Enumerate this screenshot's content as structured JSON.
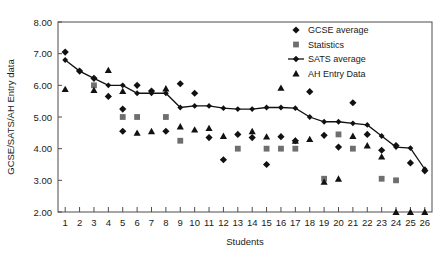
{
  "chart_data": {
    "type": "scatter",
    "title": "",
    "xlabel": "Students",
    "ylabel": "GCSE/SATS/AH Entry data",
    "xlim": [
      0.5,
      26.5
    ],
    "ylim": [
      2.0,
      8.0
    ],
    "ytick_labels": [
      "8.00",
      "7.00",
      "6.00",
      "5.00",
      "4.00",
      "3.00",
      "2.00"
    ],
    "ytick_values": [
      8,
      7,
      6,
      5,
      4,
      3,
      2
    ],
    "categories": [
      1,
      2,
      3,
      4,
      5,
      6,
      7,
      8,
      9,
      10,
      11,
      12,
      13,
      14,
      15,
      16,
      17,
      18,
      19,
      20,
      21,
      22,
      23,
      24,
      25,
      26
    ],
    "xtick_labels": [
      "1",
      "2",
      "3",
      "4",
      "5",
      "6",
      "7",
      "8",
      "9",
      "10",
      "11",
      "12",
      "13",
      "14",
      "15",
      "16",
      "17",
      "18",
      "19",
      "20",
      "21",
      "22",
      "23",
      "24",
      "25",
      "26"
    ],
    "grid": false,
    "legend_position": "top-right",
    "series": [
      {
        "name": "GCSE average",
        "marker": "diamond",
        "color": "#111111",
        "x": [
          1,
          2,
          3,
          4,
          5,
          5,
          6,
          7,
          8,
          9,
          10,
          11,
          12,
          13,
          14,
          15,
          16,
          17,
          18,
          19,
          20,
          21,
          22,
          23,
          24,
          25,
          26
        ],
        "values": [
          7.05,
          6.45,
          6.22,
          5.65,
          5.25,
          4.55,
          6.0,
          5.82,
          4.55,
          6.05,
          5.75,
          4.35,
          3.65,
          4.45,
          4.35,
          3.5,
          4.38,
          4.25,
          5.8,
          4.42,
          4.05,
          5.45,
          4.45,
          3.95,
          4.1,
          3.55,
          3.3
        ]
      },
      {
        "name": "Statistics",
        "marker": "square",
        "color": "#6e6e6e",
        "x": [
          3,
          5,
          6,
          8,
          9,
          13,
          15,
          16,
          17,
          19,
          20,
          21,
          23,
          24
        ],
        "values": [
          6.0,
          5.0,
          5.0,
          5.0,
          4.25,
          4.0,
          4.0,
          4.0,
          4.0,
          3.05,
          4.45,
          4.0,
          3.05,
          3.0
        ]
      },
      {
        "name": "SATS average",
        "marker": "line-diamond",
        "color": "#111111",
        "x": [
          1,
          2,
          3,
          4,
          5,
          6,
          7,
          8,
          9,
          10,
          11,
          12,
          13,
          14,
          15,
          16,
          17,
          18,
          19,
          20,
          21,
          22,
          23,
          24,
          25,
          26
        ],
        "values": [
          6.8,
          6.45,
          6.22,
          6.0,
          6.0,
          5.75,
          5.75,
          5.75,
          5.3,
          5.35,
          5.35,
          5.28,
          5.25,
          5.25,
          5.3,
          5.3,
          5.28,
          5.0,
          4.85,
          4.85,
          4.8,
          4.75,
          4.4,
          4.05,
          4.02,
          3.35
        ]
      },
      {
        "name": "AH Entry Data",
        "marker": "triangle",
        "color": "#111111",
        "x": [
          1,
          3,
          4,
          5,
          6,
          7,
          8,
          9,
          10,
          11,
          12,
          14,
          15,
          16,
          17,
          18,
          19,
          20,
          21,
          22,
          23,
          24,
          25,
          26
        ],
        "values": [
          5.88,
          5.85,
          6.48,
          5.82,
          4.5,
          4.55,
          5.9,
          4.7,
          4.6,
          4.65,
          4.4,
          4.55,
          4.38,
          5.92,
          4.25,
          4.3,
          2.95,
          3.05,
          4.4,
          4.1,
          3.75,
          2.0,
          2.0,
          2.0
        ]
      }
    ]
  },
  "legend": {
    "items": [
      {
        "label": "GCSE average",
        "marker": "diamond"
      },
      {
        "label": "Statistics",
        "marker": "square"
      },
      {
        "label": "SATS average",
        "marker": "line-diamond"
      },
      {
        "label": "AH Entry Data",
        "marker": "triangle"
      }
    ]
  }
}
